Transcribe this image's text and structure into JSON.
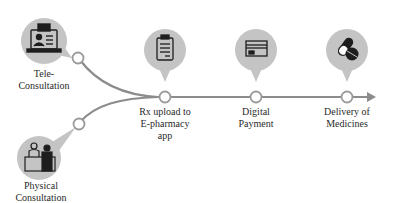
{
  "colors": {
    "line": "#8c8c8c",
    "bubble": "#c4c4c4",
    "node_fill": "#ffffff",
    "icon": "#1e1e1e"
  },
  "nodes": [
    {
      "id": "tele",
      "label_line1": "Tele-",
      "label_line2": "Consultation",
      "icon": "laptop-doctor-icon"
    },
    {
      "id": "physical",
      "label_line1": "Physical",
      "label_line2": "Consultation",
      "icon": "doctor-desk-icon"
    },
    {
      "id": "rx",
      "label_line1": "Rx upload to",
      "label_line2": "E-pharmacy",
      "label_line3": "app",
      "icon": "clipboard-prescription-icon"
    },
    {
      "id": "payment",
      "label_line1": "Digital",
      "label_line2": "Payment",
      "icon": "credit-card-icon"
    },
    {
      "id": "delivery",
      "label_line1": "Delivery of",
      "label_line2": "Medicines",
      "icon": "pills-icon"
    }
  ]
}
